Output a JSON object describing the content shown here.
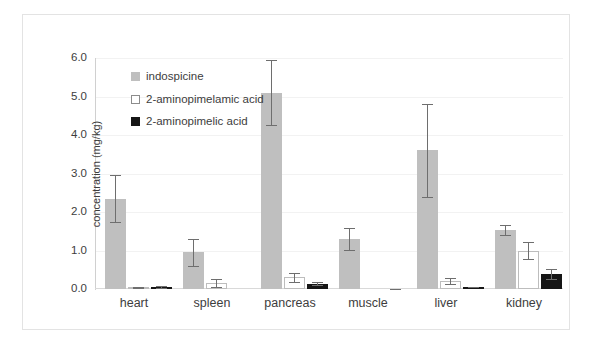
{
  "chart_data": {
    "type": "bar",
    "title": "",
    "xlabel": "",
    "ylabel": "concentration (mg/kg)",
    "ylim": [
      0.0,
      6.0
    ],
    "ytick_labels": [
      "6.0",
      "5.0",
      "4.0",
      "3.0",
      "2.0",
      "1.0",
      "0.0"
    ],
    "ytick_values": [
      6.0,
      5.0,
      4.0,
      3.0,
      2.0,
      1.0,
      0.0
    ],
    "grid": true,
    "grid_axis": "y",
    "legend_position": "upper-left-inside",
    "categories": [
      "heart",
      "spleen",
      "pancreas",
      "muscle",
      "liver",
      "kidney"
    ],
    "series": [
      {
        "name": "indospicine",
        "color": "#bfbfbf",
        "values": [
          2.35,
          0.95,
          5.1,
          1.3,
          3.6,
          1.52
        ],
        "errors": [
          0.6,
          0.35,
          0.85,
          0.28,
          1.2,
          0.13
        ]
      },
      {
        "name": "2-aminopimelamic acid",
        "color": "#ffffff",
        "values": [
          0.04,
          0.15,
          0.3,
          0.0,
          0.2,
          1.0
        ],
        "errors": [
          0.02,
          0.1,
          0.12,
          0.0,
          0.08,
          0.22
        ]
      },
      {
        "name": "2-aminopimelic acid",
        "color": "#161616",
        "values": [
          0.05,
          0.0,
          0.14,
          0.0,
          0.05,
          0.38
        ],
        "errors": [
          0.02,
          0.0,
          0.03,
          0.01,
          0.01,
          0.13
        ]
      }
    ]
  },
  "legend": {
    "items": [
      {
        "label": "indospicine"
      },
      {
        "label": "2-aminopimelamic acid"
      },
      {
        "label": "2-aminopimelic acid"
      }
    ]
  }
}
